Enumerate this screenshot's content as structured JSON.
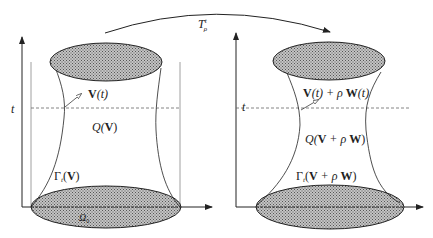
{
  "figure": {
    "type": "diagram",
    "transform_arrow": {
      "label_main": "T",
      "label_sup": "t",
      "label_sub": "ρ"
    },
    "left_panel": {
      "axis_label": "t",
      "boundary_label": "V(t)",
      "boundary_label_bold": "V",
      "boundary_label_rest": "(t)",
      "tube_label_pre": "Q(",
      "tube_label_bold": "V",
      "tube_label_post": ")",
      "lateral_label_pre": "Γ",
      "lateral_label_sub": "t",
      "lateral_label_paren_open": "(",
      "lateral_label_bold": "V",
      "lateral_label_paren_close": ")",
      "base_label": "Ω",
      "base_label_sub": "0"
    },
    "right_panel": {
      "axis_label": "t",
      "boundary_label_part1_bold": "V",
      "boundary_label_part1_rest": "(t) + ρ ",
      "boundary_label_part2_bold": "W",
      "boundary_label_part2_rest": "(t)",
      "tube_label_pre": "Q(",
      "tube_label_bold1": "V",
      "tube_label_mid": " + ρ ",
      "tube_label_bold2": "W",
      "tube_label_post": ")",
      "lateral_label_pre": "Γ",
      "lateral_label_sub": "t",
      "lateral_label_paren_open": "(",
      "lateral_label_bold1": "V",
      "lateral_label_mid": " + ρ ",
      "lateral_label_bold2": "W",
      "lateral_label_paren_close": ")"
    },
    "colors": {
      "stroke": "#222222",
      "hatch_fill": "#bdbdbd",
      "hatch_dot": "#555555",
      "dashed": "#666666",
      "guide_line": "#888888"
    }
  }
}
